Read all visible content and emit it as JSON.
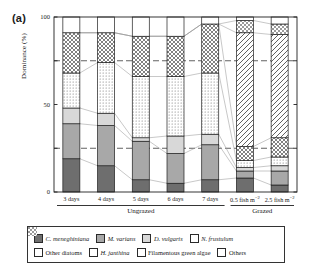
{
  "panel": {
    "label": "(a)"
  },
  "axes": {
    "ylabel": "Dominance (%)",
    "yticks": [
      "100",
      "50",
      "0"
    ],
    "ylim": [
      0,
      100
    ],
    "gridlines": [
      25,
      75
    ],
    "grid": "dashed"
  },
  "groups": [
    {
      "name": "Ungrazed",
      "span": 5
    },
    {
      "name": "Grazed",
      "span": 2
    }
  ],
  "legend": {
    "rows": [
      [
        {
          "label": "C. meneghiniana",
          "fill": "solid-dark",
          "italic": true
        },
        {
          "label": "M. varians",
          "fill": "solid-medium",
          "italic": true
        },
        {
          "label": "D. vulgaris",
          "fill": "solid-light",
          "italic": true
        },
        {
          "label": "N. frustulum",
          "fill": "dotted",
          "italic": true
        }
      ],
      [
        {
          "label": "Other diatoms",
          "fill": "crosshatch",
          "italic": false
        },
        {
          "label": "H. janthina",
          "fill": "diagonal",
          "italic": true
        },
        {
          "label": "Filamentous green algae",
          "fill": "checker",
          "italic": false
        },
        {
          "label": "Others",
          "fill": "white",
          "italic": false
        }
      ]
    ]
  },
  "colors": {
    "solid-dark": "#6e6e6e",
    "solid-medium": "#a8a8a8",
    "solid-light": "#d8d8d8",
    "white": "#ffffff",
    "stroke": "#1f1f1f",
    "grid": "#3a3a3a",
    "connector": "#9a9a9a"
  },
  "chart_data": {
    "type": "bar",
    "title": "",
    "xlabel": "",
    "ylabel": "Dominance (%)",
    "ylim": [
      0,
      100
    ],
    "stacked": true,
    "normalized_percent": true,
    "categories": [
      "3 days",
      "4 days",
      "5 days",
      "6 days",
      "7 days",
      "0.5 fish m^-2",
      "2.5 fish m^-2"
    ],
    "category_labels_html": [
      "3 days",
      "4 days",
      "5 days",
      "6 days",
      "7 days",
      "0.5 fish m<sup>&#8722;2</sup>",
      "2.5 fish m<sup>&#8722;2</sup>"
    ],
    "series": [
      {
        "name": "C. meneghiniana",
        "fill": "solid-dark",
        "values": [
          19,
          15,
          7,
          5,
          7,
          8,
          4
        ]
      },
      {
        "name": "M. varians",
        "fill": "solid-medium",
        "values": [
          20,
          23,
          22,
          17,
          20,
          4,
          8
        ]
      },
      {
        "name": "D. vulgaris",
        "fill": "solid-light",
        "values": [
          9,
          7,
          2,
          10,
          6,
          2,
          3
        ]
      },
      {
        "name": "N. frustulum",
        "fill": "dotted",
        "values": [
          20,
          29,
          35,
          34,
          35,
          4,
          5
        ]
      },
      {
        "name": "Other diatoms",
        "fill": "crosshatch",
        "values": [
          23,
          17,
          23,
          23,
          28,
          8,
          11
        ]
      },
      {
        "name": "H. janthina",
        "fill": "diagonal",
        "values": [
          0,
          0,
          0,
          0,
          0,
          65,
          59
        ]
      },
      {
        "name": "Filamentous green algae",
        "fill": "checker",
        "values": [
          0,
          0,
          0,
          0,
          0,
          7,
          6
        ]
      },
      {
        "name": "Others",
        "fill": "white",
        "values": [
          9,
          9,
          11,
          11,
          4,
          2,
          4
        ]
      }
    ],
    "connectors": true,
    "legend_position": "below"
  }
}
